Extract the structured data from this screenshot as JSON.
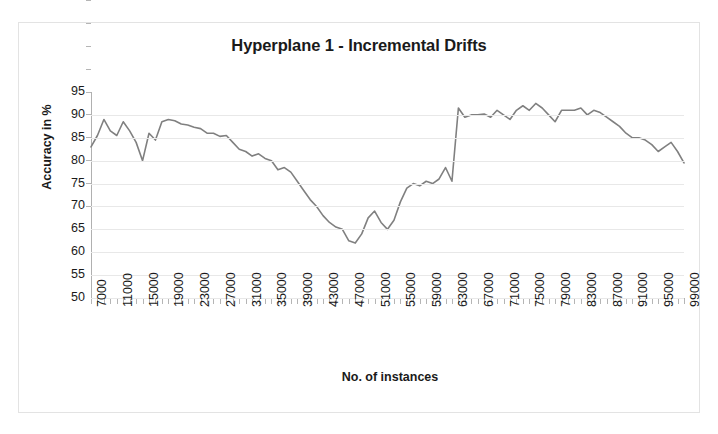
{
  "chart_data": {
    "type": "line",
    "title": "Hyperplane 1 - Incremental Drifts",
    "xlabel": "No. of instances",
    "ylabel": "Accuracy in %",
    "grid": true,
    "legend": "none",
    "line_color": "#808080",
    "ylim": [
      50,
      95
    ],
    "ytick_labels": [
      "95",
      "90",
      "85",
      "80",
      "75",
      "70",
      "65",
      "60",
      "55",
      "50"
    ],
    "yticks": [
      95,
      90,
      85,
      80,
      75,
      70,
      65,
      60,
      55,
      50
    ],
    "xlim": [
      7000,
      99000
    ],
    "xtick_labels": [
      "7000",
      "11000",
      "15000",
      "19000",
      "23000",
      "27000",
      "31000",
      "35000",
      "39000",
      "43000",
      "47000",
      "51000",
      "55000",
      "59000",
      "63000",
      "67000",
      "71000",
      "75000",
      "79000",
      "83000",
      "87000",
      "91000",
      "95000",
      "99000"
    ],
    "xticks": [
      7000,
      11000,
      15000,
      19000,
      23000,
      27000,
      31000,
      35000,
      39000,
      43000,
      47000,
      51000,
      55000,
      59000,
      63000,
      67000,
      71000,
      75000,
      79000,
      83000,
      87000,
      91000,
      95000,
      99000
    ],
    "x": [
      7000,
      8000,
      9000,
      10000,
      11000,
      12000,
      13000,
      14000,
      15000,
      16000,
      17000,
      18000,
      19000,
      20000,
      21000,
      22000,
      23000,
      24000,
      25000,
      26000,
      27000,
      28000,
      29000,
      30000,
      31000,
      32000,
      33000,
      34000,
      35000,
      36000,
      37000,
      38000,
      39000,
      40000,
      41000,
      42000,
      43000,
      44000,
      45000,
      46000,
      47000,
      48000,
      49000,
      50000,
      51000,
      52000,
      53000,
      54000,
      55000,
      56000,
      57000,
      58000,
      59000,
      60000,
      61000,
      62000,
      63000,
      64000,
      65000,
      66000,
      67000,
      68000,
      69000,
      70000,
      71000,
      72000,
      73000,
      74000,
      75000,
      76000,
      77000,
      78000,
      79000,
      80000,
      81000,
      82000,
      83000,
      84000,
      85000,
      86000,
      87000,
      88000,
      89000,
      90000,
      91000,
      92000,
      93000,
      94000,
      95000,
      96000,
      97000,
      98000,
      99000
    ],
    "y": [
      83.0,
      85.5,
      89.0,
      86.5,
      85.5,
      88.5,
      86.5,
      84.0,
      80.0,
      86.0,
      84.5,
      88.5,
      89.0,
      88.7,
      88.0,
      87.8,
      87.3,
      87.0,
      86.0,
      86.0,
      85.3,
      85.5,
      84.0,
      82.5,
      82.0,
      81.0,
      81.5,
      80.5,
      80.0,
      78.0,
      78.5,
      77.5,
      75.5,
      73.5,
      71.5,
      70.0,
      68.0,
      66.5,
      65.5,
      65.0,
      62.5,
      62.0,
      64.0,
      67.5,
      69.0,
      66.5,
      65.0,
      67.0,
      71.0,
      74.0,
      75.0,
      74.5,
      75.5,
      75.0,
      76.0,
      78.5,
      75.5,
      91.5,
      89.5,
      90.0,
      90.0,
      90.2,
      89.5,
      91.0,
      90.0,
      89.0,
      91.0,
      92.0,
      91.0,
      92.5,
      91.5,
      90.0,
      88.5,
      91.0,
      91.0,
      91.0,
      91.5,
      90.0,
      91.0,
      90.5,
      89.5,
      88.5,
      87.5,
      86.0,
      85.0,
      85.0,
      84.5,
      83.5,
      82.0,
      83.0,
      84.0,
      82.0,
      79.5
    ]
  }
}
